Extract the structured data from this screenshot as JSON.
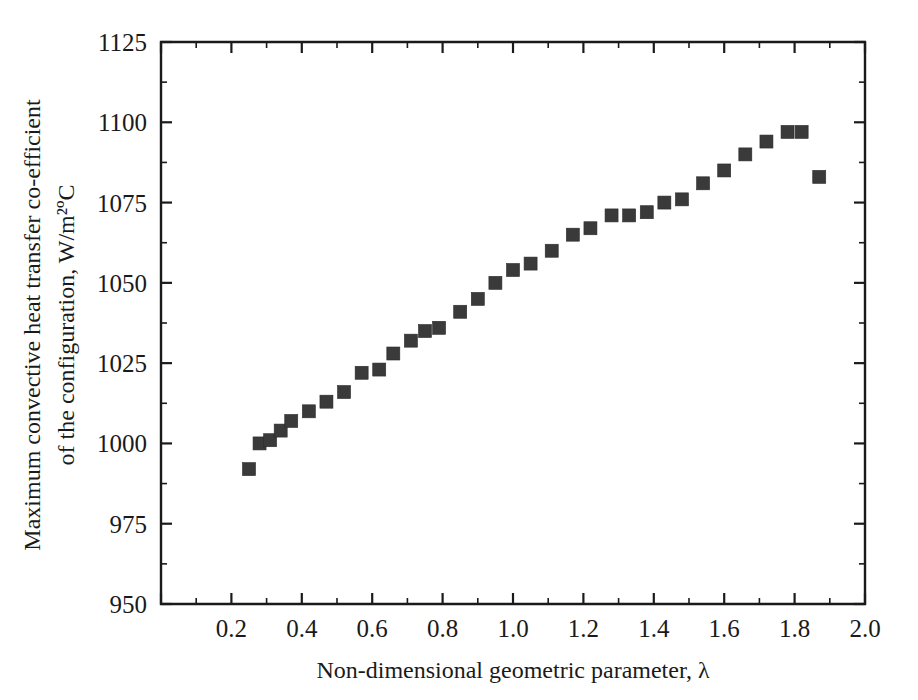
{
  "chart_data": {
    "type": "scatter",
    "title": "",
    "xlabel": "Non-dimensional geometric parameter, λ",
    "ylabel_line1": "Maximum convective heat transfer co-efficient",
    "ylabel_line2": "of the configuration,  W/m²ºC",
    "xlim": [
      0.0,
      2.0
    ],
    "ylim": [
      950,
      1125
    ],
    "xticks": [
      0.0,
      0.2,
      0.4,
      0.6,
      0.8,
      1.0,
      1.2,
      1.4,
      1.6,
      1.8,
      2.0
    ],
    "xticklabels": [
      "",
      "0.2",
      "0.4",
      "0.6",
      "0.8",
      "1.0",
      "1.2",
      "1.4",
      "1.6",
      "1.8",
      "2.0"
    ],
    "yticks": [
      950,
      975,
      1000,
      1025,
      1050,
      1075,
      1100,
      1125
    ],
    "yticklabels": [
      "950",
      "975",
      "1000",
      "1025",
      "1050",
      "1075",
      "1100",
      "1125"
    ],
    "x_minor_count": 1,
    "y_minor_count": 1,
    "grid": false,
    "legend": "none",
    "marker_shape": "square",
    "marker_size": 13,
    "marker_color": "#3a3a3a",
    "x": [
      0.25,
      0.28,
      0.31,
      0.34,
      0.37,
      0.42,
      0.47,
      0.52,
      0.57,
      0.62,
      0.66,
      0.71,
      0.75,
      0.79,
      0.85,
      0.9,
      0.95,
      1.0,
      1.05,
      1.11,
      1.17,
      1.22,
      1.28,
      1.33,
      1.38,
      1.43,
      1.48,
      1.54,
      1.6,
      1.66,
      1.72,
      1.78,
      1.82,
      1.87
    ],
    "y": [
      992,
      1000,
      1001,
      1004,
      1007,
      1010,
      1013,
      1016,
      1022,
      1023,
      1028,
      1032,
      1035,
      1036,
      1041,
      1045,
      1050,
      1054,
      1056,
      1060,
      1065,
      1067,
      1071,
      1071,
      1072,
      1075,
      1076,
      1081,
      1085,
      1090,
      1094,
      1097,
      1097,
      1083
    ]
  }
}
